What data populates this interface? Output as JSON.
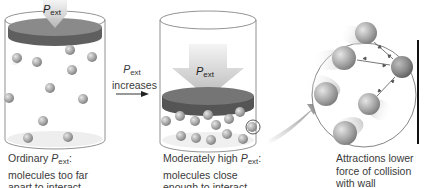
{
  "diagram": {
    "panels": [
      {
        "id": "ordinary",
        "piston_label": {
          "symbol": "P",
          "subscript": "ext"
        },
        "caption": {
          "line1_prefix": "Ordinary ",
          "line1_symbol": "P",
          "line1_subscript": "ext",
          "line1_suffix": ":",
          "line2": "molecules too far",
          "line3": "apart to interact"
        }
      },
      {
        "id": "moderately-high",
        "piston_label": {
          "symbol": "P",
          "subscript": "ext"
        },
        "caption": {
          "line1_prefix": "Moderately high ",
          "line1_symbol": "P",
          "line1_subscript": "ext",
          "line1_suffix": ":",
          "line2": "molecules close",
          "line3": "enough to interact"
        }
      },
      {
        "id": "zoom-detail",
        "caption": {
          "line1": "Attractions lower",
          "line2": "force of collision",
          "line3": "with wall"
        }
      }
    ],
    "transition_arrow": {
      "symbol": "P",
      "subscript": "ext",
      "text": "increases"
    },
    "colors": {
      "piston": "#6f6f6f",
      "piston_top": "#8a8a8a",
      "arrow": "#c8c8c8",
      "molecule": "#a9a9a9",
      "outline": "#555555",
      "wall": "#111111"
    }
  }
}
